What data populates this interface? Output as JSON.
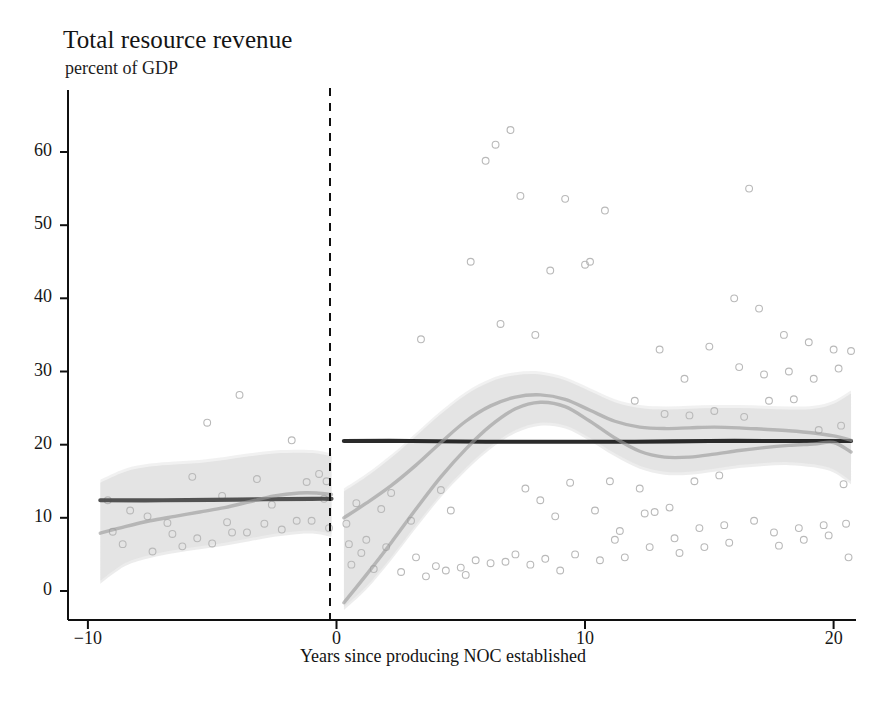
{
  "chart_data": {
    "type": "scatter",
    "title": "Total resource revenue",
    "subtitle": "percent of GDP",
    "xlabel": "Years since producing NOC established",
    "ylabel": "",
    "xlim": [
      -10.8,
      20.9
    ],
    "ylim": [
      -3,
      66
    ],
    "xticks": [
      -10,
      0,
      10,
      20
    ],
    "xticklabels": [
      "−10",
      "0",
      "10",
      "20"
    ],
    "yticks": [
      0,
      10,
      20,
      30,
      40,
      50,
      60
    ],
    "yticklabels": [
      "0",
      "10",
      "20",
      "30",
      "40",
      "50",
      "60"
    ],
    "grid": false,
    "legend": null,
    "reference_line": {
      "name": "noc-establishment-line",
      "x": 0,
      "style": "dashed",
      "color": "#1a1a1a"
    },
    "panels": [
      {
        "name": "pre-noc-panel",
        "x_range": [
          -9.5,
          -0.2
        ],
        "fits": [
          {
            "name": "mean-level-line",
            "style": "solid-dark",
            "color": "#4a4a4a",
            "points": [
              [
                -9.5,
                12.4
              ],
              [
                -7,
                12.4
              ],
              [
                -4,
                12.5
              ],
              [
                -1,
                12.6
              ],
              [
                -0.2,
                12.6
              ]
            ]
          },
          {
            "name": "local-polynomial-fit",
            "style": "solid-light",
            "color": "#9a9a9a",
            "points": [
              [
                -9.5,
                7.9
              ],
              [
                -8.5,
                8.8
              ],
              [
                -7.5,
                9.6
              ],
              [
                -6.5,
                10.2
              ],
              [
                -5.5,
                10.8
              ],
              [
                -4.5,
                11.4
              ],
              [
                -3.5,
                12.2
              ],
              [
                -2.5,
                13.0
              ],
              [
                -1.5,
                13.4
              ],
              [
                -0.8,
                13.4
              ],
              [
                -0.2,
                13.2
              ]
            ]
          }
        ],
        "confidence_band": {
          "name": "confidence-band",
          "color": "#cfcfcf",
          "upper": [
            [
              -9.5,
              14.8
            ],
            [
              -8.5,
              16.3
            ],
            [
              -7.5,
              17.0
            ],
            [
              -6.5,
              17.3
            ],
            [
              -5.5,
              17.5
            ],
            [
              -4.5,
              17.9
            ],
            [
              -3.5,
              18.4
            ],
            [
              -2.5,
              18.8
            ],
            [
              -1.5,
              18.9
            ],
            [
              -0.8,
              18.8
            ],
            [
              -0.2,
              18.4
            ]
          ],
          "lower": [
            [
              -9.5,
              1.0
            ],
            [
              -8.5,
              3.4
            ],
            [
              -7.5,
              4.5
            ],
            [
              -6.5,
              5.2
            ],
            [
              -5.5,
              5.7
            ],
            [
              -4.5,
              6.2
            ],
            [
              -3.5,
              6.8
            ],
            [
              -2.5,
              7.4
            ],
            [
              -1.5,
              7.8
            ],
            [
              -0.8,
              7.8
            ],
            [
              -0.2,
              7.4
            ]
          ]
        },
        "scatter": [
          [
            -9.2,
            12.4
          ],
          [
            -9.0,
            8.1
          ],
          [
            -8.6,
            6.4
          ],
          [
            -8.3,
            11.0
          ],
          [
            -7.6,
            10.2
          ],
          [
            -7.4,
            5.4
          ],
          [
            -6.8,
            9.3
          ],
          [
            -6.6,
            7.8
          ],
          [
            -6.2,
            6.1
          ],
          [
            -5.8,
            15.6
          ],
          [
            -5.6,
            7.2
          ],
          [
            -5.2,
            23.0
          ],
          [
            -5.0,
            6.5
          ],
          [
            -4.6,
            13.0
          ],
          [
            -4.4,
            9.4
          ],
          [
            -4.2,
            8.0
          ],
          [
            -3.9,
            26.8
          ],
          [
            -3.6,
            8.0
          ],
          [
            -3.2,
            15.3
          ],
          [
            -2.9,
            9.2
          ],
          [
            -2.6,
            11.8
          ],
          [
            -2.2,
            8.4
          ],
          [
            -1.8,
            20.6
          ],
          [
            -1.6,
            9.6
          ],
          [
            -1.2,
            14.9
          ],
          [
            -1.0,
            9.6
          ],
          [
            -0.7,
            16.0
          ],
          [
            -0.5,
            12.6
          ],
          [
            -0.4,
            15.0
          ],
          [
            -0.3,
            8.6
          ]
        ]
      },
      {
        "name": "post-noc-panel",
        "x_range": [
          0.3,
          20.7
        ],
        "fits": [
          {
            "name": "mean-level-line",
            "style": "solid-dark",
            "color": "#1f1f1f",
            "points": [
              [
                0.3,
                20.5
              ],
              [
                3,
                20.5
              ],
              [
                6,
                20.4
              ],
              [
                9,
                20.4
              ],
              [
                12,
                20.4
              ],
              [
                15,
                20.5
              ],
              [
                18,
                20.5
              ],
              [
                20.7,
                20.5
              ]
            ]
          },
          {
            "name": "local-polynomial-fit-upper",
            "style": "solid-light",
            "color": "#9a9a9a",
            "points": [
              [
                0.3,
                10.0
              ],
              [
                1.2,
                12.0
              ],
              [
                2.2,
                14.4
              ],
              [
                3.2,
                17.2
              ],
              [
                4.2,
                20.3
              ],
              [
                5.2,
                23.2
              ],
              [
                6.2,
                25.3
              ],
              [
                7.2,
                26.5
              ],
              [
                8.2,
                26.8
              ],
              [
                9.2,
                26.2
              ],
              [
                10.2,
                24.7
              ],
              [
                11.2,
                23.2
              ],
              [
                12.2,
                22.4
              ],
              [
                13.2,
                22.2
              ],
              [
                14.2,
                22.3
              ],
              [
                15.2,
                22.4
              ],
              [
                16.2,
                22.3
              ],
              [
                17.2,
                22.1
              ],
              [
                18.2,
                21.9
              ],
              [
                19.2,
                21.6
              ],
              [
                20.0,
                21.2
              ],
              [
                20.7,
                20.6
              ]
            ]
          },
          {
            "name": "local-polynomial-fit-lower",
            "style": "solid-light",
            "color": "#9a9a9a",
            "points": [
              [
                0.3,
                -1.6
              ],
              [
                1.2,
                2.2
              ],
              [
                2.2,
                6.6
              ],
              [
                3.2,
                11.2
              ],
              [
                4.2,
                15.6
              ],
              [
                5.2,
                19.4
              ],
              [
                6.2,
                22.6
              ],
              [
                7.2,
                24.9
              ],
              [
                8.2,
                25.8
              ],
              [
                9.2,
                25.2
              ],
              [
                10.2,
                23.2
              ],
              [
                11.2,
                20.9
              ],
              [
                12.2,
                19.1
              ],
              [
                13.2,
                18.3
              ],
              [
                14.2,
                18.3
              ],
              [
                15.2,
                18.7
              ],
              [
                16.2,
                19.2
              ],
              [
                17.2,
                19.6
              ],
              [
                18.2,
                19.9
              ],
              [
                19.2,
                20.1
              ],
              [
                20.0,
                20.3
              ],
              [
                20.7,
                19.0
              ]
            ]
          }
        ],
        "confidence_band": {
          "name": "confidence-band",
          "color": "#d2d2d2",
          "upper": [
            [
              0.3,
              13.6
            ],
            [
              1.2,
              15.6
            ],
            [
              2.2,
              18.2
            ],
            [
              3.2,
              21.2
            ],
            [
              4.2,
              24.2
            ],
            [
              5.2,
              26.8
            ],
            [
              6.2,
              28.6
            ],
            [
              7.2,
              29.5
            ],
            [
              8.2,
              29.6
            ],
            [
              9.2,
              28.8
            ],
            [
              10.2,
              27.3
            ],
            [
              11.2,
              25.8
            ],
            [
              12.2,
              25.0
            ],
            [
              13.2,
              24.8
            ],
            [
              14.2,
              24.9
            ],
            [
              15.2,
              25.0
            ],
            [
              16.2,
              25.0
            ],
            [
              17.2,
              24.9
            ],
            [
              18.2,
              24.8
            ],
            [
              19.2,
              24.9
            ],
            [
              20.0,
              25.6
            ],
            [
              20.7,
              27.0
            ]
          ],
          "lower": [
            [
              0.3,
              -2.6
            ],
            [
              1.2,
              0.2
            ],
            [
              2.2,
              4.2
            ],
            [
              3.2,
              8.6
            ],
            [
              4.2,
              12.8
            ],
            [
              5.2,
              16.4
            ],
            [
              6.2,
              19.4
            ],
            [
              7.2,
              21.6
            ],
            [
              8.2,
              22.6
            ],
            [
              9.2,
              22.2
            ],
            [
              10.2,
              20.5
            ],
            [
              11.2,
              18.4
            ],
            [
              12.2,
              16.7
            ],
            [
              13.2,
              15.9
            ],
            [
              14.2,
              15.9
            ],
            [
              15.2,
              16.3
            ],
            [
              16.2,
              16.8
            ],
            [
              17.2,
              17.1
            ],
            [
              18.2,
              17.2
            ],
            [
              19.2,
              16.9
            ],
            [
              20.0,
              16.2
            ],
            [
              20.7,
              14.6
            ]
          ]
        },
        "scatter": [
          [
            0.4,
            9.2
          ],
          [
            0.5,
            6.4
          ],
          [
            0.6,
            3.6
          ],
          [
            0.8,
            12.0
          ],
          [
            1.0,
            5.2
          ],
          [
            1.2,
            7.0
          ],
          [
            1.5,
            3.0
          ],
          [
            1.8,
            11.2
          ],
          [
            2.0,
            6.0
          ],
          [
            2.2,
            13.4
          ],
          [
            2.6,
            2.6
          ],
          [
            3.0,
            9.6
          ],
          [
            3.2,
            4.6
          ],
          [
            3.4,
            34.4
          ],
          [
            3.6,
            2.0
          ],
          [
            4.0,
            3.4
          ],
          [
            4.2,
            13.8
          ],
          [
            4.4,
            2.8
          ],
          [
            4.6,
            11.0
          ],
          [
            5.0,
            3.2
          ],
          [
            5.2,
            2.2
          ],
          [
            5.4,
            45.0
          ],
          [
            5.6,
            4.2
          ],
          [
            6.0,
            58.8
          ],
          [
            6.2,
            3.8
          ],
          [
            6.4,
            61.0
          ],
          [
            6.6,
            36.5
          ],
          [
            6.8,
            4.0
          ],
          [
            7.0,
            63.0
          ],
          [
            7.2,
            5.0
          ],
          [
            7.4,
            54.0
          ],
          [
            7.6,
            14.0
          ],
          [
            7.8,
            3.6
          ],
          [
            8.0,
            35.0
          ],
          [
            8.2,
            12.4
          ],
          [
            8.4,
            4.4
          ],
          [
            8.6,
            43.8
          ],
          [
            8.8,
            10.2
          ],
          [
            9.0,
            2.8
          ],
          [
            9.2,
            53.6
          ],
          [
            9.4,
            14.8
          ],
          [
            9.6,
            5.0
          ],
          [
            10.0,
            44.6
          ],
          [
            10.2,
            45.0
          ],
          [
            10.4,
            11.0
          ],
          [
            10.6,
            4.2
          ],
          [
            10.8,
            52.0
          ],
          [
            11.0,
            15.0
          ],
          [
            11.2,
            7.0
          ],
          [
            11.4,
            8.2
          ],
          [
            11.6,
            4.6
          ],
          [
            12.0,
            26.0
          ],
          [
            12.2,
            14.0
          ],
          [
            12.4,
            10.6
          ],
          [
            12.6,
            6.0
          ],
          [
            12.8,
            10.8
          ],
          [
            13.0,
            33.0
          ],
          [
            13.2,
            24.2
          ],
          [
            13.4,
            11.4
          ],
          [
            13.6,
            7.2
          ],
          [
            13.8,
            5.2
          ],
          [
            14.0,
            29.0
          ],
          [
            14.2,
            24.0
          ],
          [
            14.4,
            15.0
          ],
          [
            14.6,
            8.6
          ],
          [
            14.8,
            6.0
          ],
          [
            15.0,
            33.4
          ],
          [
            15.2,
            24.6
          ],
          [
            15.4,
            15.8
          ],
          [
            15.6,
            9.0
          ],
          [
            15.8,
            6.6
          ],
          [
            16.0,
            40.0
          ],
          [
            16.2,
            30.6
          ],
          [
            16.4,
            23.8
          ],
          [
            16.6,
            55.0
          ],
          [
            16.8,
            9.6
          ],
          [
            17.0,
            38.6
          ],
          [
            17.2,
            29.6
          ],
          [
            17.4,
            26.0
          ],
          [
            17.6,
            8.0
          ],
          [
            17.8,
            6.2
          ],
          [
            18.0,
            35.0
          ],
          [
            18.2,
            30.0
          ],
          [
            18.4,
            26.2
          ],
          [
            18.6,
            8.6
          ],
          [
            18.8,
            7.0
          ],
          [
            19.0,
            34.0
          ],
          [
            19.2,
            29.0
          ],
          [
            19.4,
            22.0
          ],
          [
            19.6,
            9.0
          ],
          [
            19.8,
            7.6
          ],
          [
            20.0,
            33.0
          ],
          [
            20.2,
            30.4
          ],
          [
            20.3,
            22.6
          ],
          [
            20.4,
            14.6
          ],
          [
            20.5,
            9.2
          ],
          [
            20.6,
            4.6
          ],
          [
            20.7,
            32.8
          ]
        ]
      }
    ]
  },
  "axes": {
    "ytick_labels": [
      "60",
      "50",
      "40",
      "30",
      "20",
      "10",
      "0"
    ],
    "xtick_labels": [
      "−10",
      "0",
      "10",
      "20"
    ]
  }
}
